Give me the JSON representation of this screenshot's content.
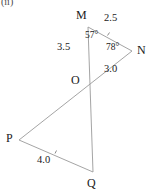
{
  "figure": {
    "part_label": "(ii)",
    "stroke_color": "#9a9a9a",
    "text_color": "#1a1a1a",
    "background_color": "#ffffff",
    "vertices": [
      {
        "name": "M",
        "label": "M",
        "x": 88,
        "y": 27,
        "label_x": 76,
        "label_y": 11
      },
      {
        "name": "N",
        "label": "N",
        "x": 132,
        "y": 51,
        "label_x": 137,
        "label_y": 45
      },
      {
        "name": "O",
        "label": "O",
        "x": 86,
        "y": 81,
        "label_x": 72,
        "label_y": 74
      },
      {
        "name": "P",
        "label": "P",
        "x": 19,
        "y": 140,
        "label_x": 7,
        "label_y": 133
      },
      {
        "name": "Q",
        "label": "Q",
        "x": 93,
        "y": 172,
        "label_x": 87,
        "label_y": 177
      }
    ],
    "segments": [
      {
        "name": "segment-MN",
        "from": "M",
        "to": "N"
      },
      {
        "name": "segment-MQ",
        "from": "M",
        "to": "Q"
      },
      {
        "name": "segment-NP",
        "from": "N",
        "to": "P"
      },
      {
        "name": "segment-PQ",
        "from": "P",
        "to": "Q"
      }
    ],
    "side_labels": [
      {
        "name": "length-MN",
        "text": "2.5",
        "x": 104,
        "y": 15
      },
      {
        "name": "length-MO",
        "text": "3.5",
        "x": 58,
        "y": 44
      },
      {
        "name": "length-ON",
        "text": "3.0",
        "x": 104,
        "y": 66
      },
      {
        "name": "length-PQ",
        "text": "4.0",
        "x": 38,
        "y": 153
      }
    ],
    "angle_labels": [
      {
        "name": "angle-M",
        "text": "57°",
        "x": 85,
        "y": 32
      },
      {
        "name": "angle-N",
        "text": "78°",
        "x": 107,
        "y": 44
      }
    ],
    "tick_marks": [
      {
        "name": "tick-MN",
        "x": 107,
        "y": 32,
        "angle": 28
      },
      {
        "name": "tick-PQ",
        "x": 55,
        "y": 151,
        "angle": 24
      }
    ]
  }
}
